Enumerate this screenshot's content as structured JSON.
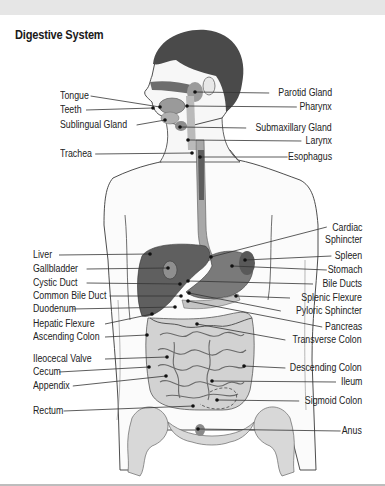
{
  "title": "Digestive System",
  "colors": {
    "organ_dark": "#5a5a5a",
    "organ_mid": "#8c8c8c",
    "organ_light": "#bdbdbd",
    "skin_outline": "#3a3a3a",
    "hair": "#3f3f3f",
    "leader": "#333333",
    "band": "#e6e6e6"
  },
  "labels_left": [
    {
      "text": "Tongue",
      "x": 60,
      "y": 90,
      "lx2": 160,
      "ly2": 107
    },
    {
      "text": "Teeth",
      "x": 60,
      "y": 104,
      "lx2": 153,
      "ly2": 108
    },
    {
      "text": "Sublingual Gland",
      "x": 60,
      "y": 119,
      "lx2": 165,
      "ly2": 120
    },
    {
      "text": "Trachea",
      "x": 60,
      "y": 148,
      "lx2": 192,
      "ly2": 153
    },
    {
      "text": "Liver",
      "x": 33,
      "y": 249,
      "lx2": 150,
      "ly2": 254
    },
    {
      "text": "Gallbladder",
      "x": 33,
      "y": 263,
      "lx2": 168,
      "ly2": 268
    },
    {
      "text": "Cystic Duct",
      "x": 33,
      "y": 277,
      "lx2": 180,
      "ly2": 284
    },
    {
      "text": "Common Bile Duct",
      "x": 33,
      "y": 290,
      "lx2": 181,
      "ly2": 296
    },
    {
      "text": "Duodenum",
      "x": 33,
      "y": 303,
      "lx2": 175,
      "ly2": 307
    },
    {
      "text": "Hepatic Flexure",
      "x": 33,
      "y": 318,
      "lx2": 152,
      "ly2": 314
    },
    {
      "text": "Ascending Colon",
      "x": 33,
      "y": 331,
      "lx2": 147,
      "ly2": 335
    },
    {
      "text": "Ileocecal Valve",
      "x": 33,
      "y": 353,
      "lx2": 167,
      "ly2": 357
    },
    {
      "text": "Cecum",
      "x": 33,
      "y": 366,
      "lx2": 149,
      "ly2": 367
    },
    {
      "text": "Appendix",
      "x": 33,
      "y": 380,
      "lx2": 166,
      "ly2": 376
    },
    {
      "text": "Rectum",
      "x": 33,
      "y": 405,
      "lx2": 193,
      "ly2": 406
    }
  ],
  "labels_right": [
    {
      "text": "Parotid Gland",
      "x": 332,
      "y": 87,
      "lx2": 195,
      "ly2": 92
    },
    {
      "text": "Pharynx",
      "x": 332,
      "y": 101,
      "lx2": 187,
      "ly2": 106
    },
    {
      "text": "Submaxillary Gland",
      "x": 332,
      "y": 122,
      "lx2": 180,
      "ly2": 127
    },
    {
      "text": "Larynx",
      "x": 332,
      "y": 135,
      "lx2": 188,
      "ly2": 140
    },
    {
      "text": "Esophagus",
      "x": 332,
      "y": 151,
      "lx2": 200,
      "ly2": 157
    },
    {
      "text": "Cardiac",
      "x": 362,
      "y": 222,
      "lx2": 211,
      "ly2": 257,
      "line_y": 227
    },
    {
      "text": "Sphincter",
      "x": 362,
      "y": 234,
      "nolines": true
    },
    {
      "text": "Spleen",
      "x": 362,
      "y": 250,
      "lx2": 245,
      "ly2": 260
    },
    {
      "text": "Stomach",
      "x": 362,
      "y": 264,
      "lx2": 232,
      "ly2": 266
    },
    {
      "text": "Bile Ducts",
      "x": 362,
      "y": 278,
      "lx2": 188,
      "ly2": 281
    },
    {
      "text": "Splenic Flexure",
      "x": 362,
      "y": 292,
      "lx2": 236,
      "ly2": 296
    },
    {
      "text": "Pyloric Sphincter",
      "x": 362,
      "y": 305,
      "lx2": 189,
      "ly2": 293
    },
    {
      "text": "Pancreas",
      "x": 362,
      "y": 321,
      "lx2": 188,
      "ly2": 301
    },
    {
      "text": "Transverse Colon",
      "x": 362,
      "y": 334,
      "lx2": 197,
      "ly2": 324
    },
    {
      "text": "Descending Colon",
      "x": 362,
      "y": 362,
      "lx2": 244,
      "ly2": 366
    },
    {
      "text": "Ileum",
      "x": 362,
      "y": 376,
      "lx2": 212,
      "ly2": 381
    },
    {
      "text": "Sigmoid Colon",
      "x": 362,
      "y": 395,
      "lx2": 217,
      "ly2": 400
    },
    {
      "text": "Anus",
      "x": 362,
      "y": 425,
      "lx2": 198,
      "ly2": 429
    }
  ]
}
